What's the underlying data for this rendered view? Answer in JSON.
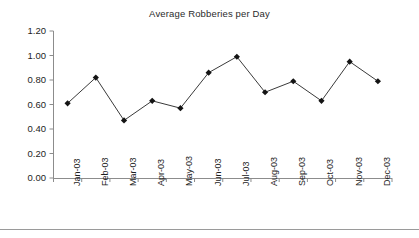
{
  "chart_data": {
    "type": "line",
    "title": "Average Robberies per Day",
    "xlabel": "",
    "ylabel": "",
    "categories": [
      "Jan-03",
      "Feb-03",
      "Mar-03",
      "Apr-03",
      "May-03",
      "Jun-03",
      "Jul-03",
      "Aug-03",
      "Sep-03",
      "Oct-03",
      "Nov-03",
      "Dec-03"
    ],
    "values": [
      0.61,
      0.82,
      0.47,
      0.63,
      0.57,
      0.86,
      0.99,
      0.7,
      0.79,
      0.63,
      0.95,
      0.79
    ],
    "ylim": [
      0.0,
      1.2
    ],
    "ytick_labels": [
      "0.00",
      "0.20",
      "0.40",
      "0.60",
      "0.80",
      "1.00",
      "1.20"
    ],
    "ytick_values": [
      0.0,
      0.2,
      0.4,
      0.6,
      0.8,
      1.0,
      1.2
    ],
    "grid": false,
    "legend": false,
    "legend_position": "none",
    "series_name": "Average Robberies per Day",
    "marker": "diamond",
    "line_color": "#3a3a3a",
    "marker_color": "#141414",
    "axis_color": "#8c8c8c"
  }
}
